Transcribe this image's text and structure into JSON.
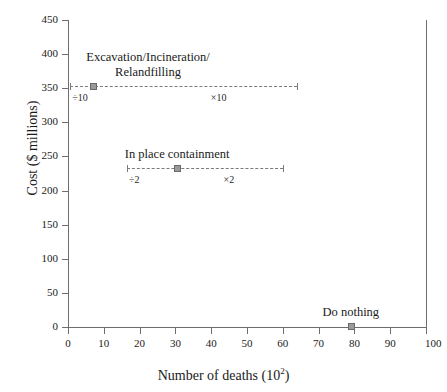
{
  "chart_data": {
    "type": "scatter",
    "title": "",
    "xlabel": "Number of deaths (10",
    "xlabel_sup": "2",
    "xlabel_tail": ")",
    "ylabel": "Cost ($ millions)",
    "xlim": [
      0,
      100
    ],
    "ylim": [
      0,
      450
    ],
    "grid": false,
    "legend": "none (inline annotations)",
    "xticks": [
      0,
      10,
      20,
      30,
      40,
      50,
      60,
      70,
      80,
      90,
      100
    ],
    "xtick_labels": [
      "0",
      "10",
      "20",
      "30",
      "40",
      "50",
      "60",
      "70",
      "80",
      "90",
      "100"
    ],
    "yticks": [
      0,
      50,
      100,
      150,
      200,
      250,
      300,
      350,
      400,
      450
    ],
    "ytick_labels": [
      "0",
      "50",
      "100",
      "150",
      "200",
      "250",
      "300",
      "350",
      "400",
      "450"
    ],
    "series": [
      {
        "name": "Excavation/Incineration/Relandfilling",
        "label_line1": "Excavation/Incineration/",
        "label_line2": "Relandfilling",
        "x": 7,
        "y": 353,
        "x_low": 0.6,
        "x_high": 64,
        "low_label": "÷10",
        "high_label": "×10"
      },
      {
        "name": "In place containment",
        "label_line1": "In place containment",
        "label_line2": "",
        "x": 30.5,
        "y": 233,
        "x_low": 16.5,
        "x_high": 60,
        "low_label": "÷2",
        "high_label": "×2"
      },
      {
        "name": "Do nothing",
        "label_line1": "Do nothing",
        "label_line2": "",
        "x": 79,
        "y": 2,
        "x_low": null,
        "x_high": null,
        "low_label": "",
        "high_label": ""
      }
    ]
  },
  "colors": {
    "axis": "#6e6e6e",
    "marker_fill": "#9a9a9a",
    "marker_edge": "#6a6a6a",
    "errorbar": "#7a7a7a",
    "text": "#1a1a1a",
    "background": "#ffffff"
  }
}
